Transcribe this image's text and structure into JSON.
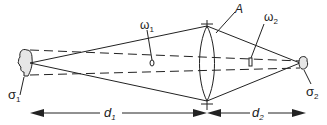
{
  "diagram": {
    "labels": {
      "sigma1": "σ",
      "sigma1_sub": "1",
      "sigma2": "σ",
      "sigma2_sub": "2",
      "omega1": "ω",
      "omega1_sub": "1",
      "omega2": "ω",
      "omega2_sub": "2",
      "lens": "A",
      "d1": "d",
      "d1_sub": "1",
      "d2": "d",
      "d2_sub": "2"
    },
    "colors": {
      "stroke": "#222222",
      "fill": "#e6e6e6"
    }
  }
}
